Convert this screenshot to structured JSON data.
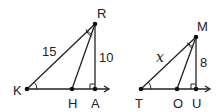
{
  "figures": [
    {
      "id": "left",
      "vertices": {
        "R": "R",
        "K": "K",
        "H": "H",
        "A": "A"
      },
      "side_labels": {
        "KR": "15",
        "RA": "10"
      },
      "marks": [
        "right-angle at A",
        "angle mark at K",
        "double angle mark at R (angle KRH)"
      ]
    },
    {
      "id": "right",
      "vertices": {
        "M": "M",
        "T": "T",
        "O": "O",
        "U": "U"
      },
      "side_labels": {
        "TM": "x",
        "MU": "8"
      },
      "marks": [
        "right-angle at U",
        "angle mark at T",
        "double angle mark at M (angle TMO)"
      ]
    }
  ]
}
